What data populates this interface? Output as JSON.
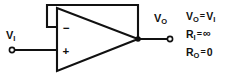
{
  "figure": {
    "background_color": "#ffffff",
    "line_color": "#111111",
    "width": 232,
    "height": 76
  },
  "amplifier": {
    "component": "operational amplifier",
    "inverting_input_sign": "−",
    "noninverting_input_sign": "+"
  },
  "ports": {
    "input_label_main": "V",
    "input_label_sub": "I",
    "output_label_main": "V",
    "output_label_sub": "O"
  },
  "equations": [
    {
      "lhs_main": "V",
      "lhs_sub": "O",
      "operator": "=",
      "rhs_main": "V",
      "rhs_sub": "I"
    },
    {
      "lhs_main": "R",
      "lhs_sub": "I",
      "operator": "=",
      "rhs_main": "∞",
      "rhs_sub": ""
    },
    {
      "lhs_main": "R",
      "lhs_sub": "O",
      "operator": "=",
      "rhs_main": "0",
      "rhs_sub": ""
    }
  ]
}
